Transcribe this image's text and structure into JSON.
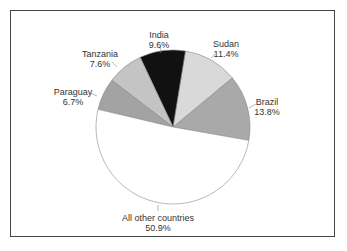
{
  "chart_data": {
    "type": "pie",
    "title": "",
    "categories": [
      "Brazil",
      "Sudan",
      "India",
      "Tanzania",
      "Paraguay",
      "All other countries"
    ],
    "values": [
      13.8,
      11.4,
      9.6,
      7.6,
      6.7,
      50.9
    ],
    "labels": [
      {
        "name": "Brazil",
        "pct": "13.8%"
      },
      {
        "name": "Sudan",
        "pct": "11.4%"
      },
      {
        "name": "India",
        "pct": "9.6%"
      },
      {
        "name": "Tanzania",
        "pct": "7.6%"
      },
      {
        "name": "Paraguay",
        "pct": "6.7%"
      },
      {
        "name": "All other countries",
        "pct": "50.9%"
      }
    ],
    "colors": [
      "#a9a9a9",
      "#d9d9d9",
      "#111111",
      "#c4c4c4",
      "#a3a3a3",
      "#ffffff"
    ],
    "legend": "none (direct labels with leader lines)"
  }
}
